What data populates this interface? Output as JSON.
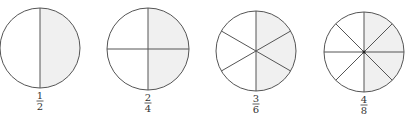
{
  "colors": {
    "stroke": "#555555",
    "shade": "#f0f0f0",
    "background": "#ffffff",
    "text": "#333333"
  },
  "figures": [
    {
      "id": "half",
      "numerator": "1",
      "denominator": "2",
      "parts": 2,
      "shaded": 1,
      "cx": 40,
      "cy": 48,
      "r": 40
    },
    {
      "id": "two-quarters",
      "numerator": "2",
      "denominator": "4",
      "parts": 4,
      "shaded": 2,
      "cx": 148,
      "cy": 49,
      "r": 41
    },
    {
      "id": "three-sixths",
      "numerator": "3",
      "denominator": "6",
      "parts": 6,
      "shaded": 3,
      "cx": 256,
      "cy": 51,
      "r": 40
    },
    {
      "id": "four-eighths",
      "numerator": "4",
      "denominator": "8",
      "parts": 8,
      "shaded": 4,
      "cx": 364,
      "cy": 52,
      "r": 40
    }
  ]
}
